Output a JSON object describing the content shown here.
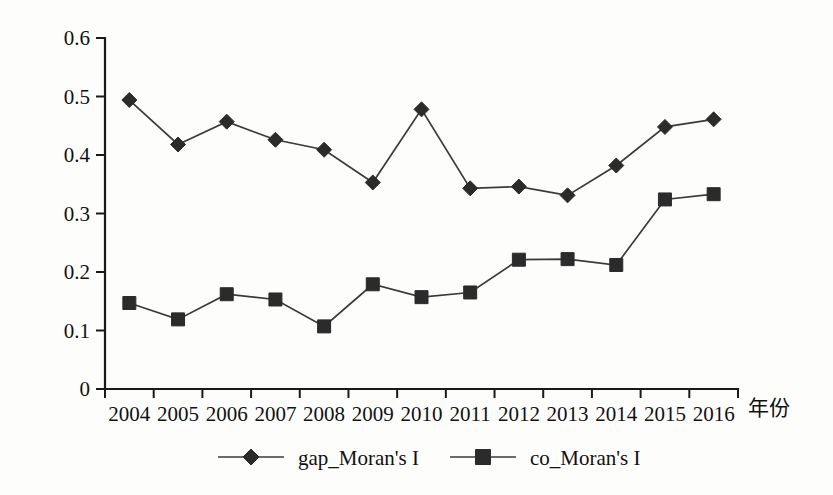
{
  "figure": {
    "background_color": "#fdfdfc",
    "ink_color": "#1a1a1a"
  },
  "chart_data": {
    "type": "line",
    "title": "",
    "xlabel": "年份",
    "ylabel": "",
    "categories": [
      "2004",
      "2005",
      "2006",
      "2007",
      "2008",
      "2009",
      "2010",
      "2011",
      "2012",
      "2013",
      "2014",
      "2015",
      "2016"
    ],
    "ylim": [
      0,
      0.6
    ],
    "yticks": [
      0,
      0.1,
      0.2,
      0.3,
      0.4,
      0.5,
      0.6
    ],
    "ytick_labels": [
      "0",
      "0.1",
      "0.2",
      "0.3",
      "0.4",
      "0.5",
      "0.6"
    ],
    "grid": false,
    "legend_position": "bottom-center",
    "series": [
      {
        "name": "gap_Moran's I",
        "marker": "diamond",
        "color": "#2b2b2b",
        "values": [
          0.494,
          0.418,
          0.457,
          0.426,
          0.409,
          0.353,
          0.478,
          0.343,
          0.346,
          0.331,
          0.382,
          0.448,
          0.461
        ]
      },
      {
        "name": "co_Moran's I",
        "marker": "square",
        "color": "#2b2b2b",
        "values": [
          0.147,
          0.119,
          0.162,
          0.153,
          0.107,
          0.179,
          0.157,
          0.165,
          0.221,
          0.222,
          0.212,
          0.324,
          0.333
        ]
      }
    ]
  },
  "legend": {
    "items": [
      {
        "label": "gap_Moran's I",
        "marker": "diamond"
      },
      {
        "label": "co_Moran's I",
        "marker": "square"
      }
    ]
  },
  "axis": {
    "x_axis_title": "年份"
  }
}
